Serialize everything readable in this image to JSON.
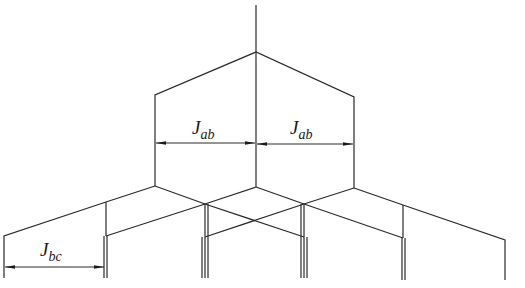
{
  "diagram": {
    "labels": [
      {
        "id": "jab-left",
        "main": "J",
        "sub": "ab",
        "x": 190,
        "y": 118
      },
      {
        "id": "jab-right",
        "main": "J",
        "sub": "ab",
        "x": 290,
        "y": 118
      },
      {
        "id": "jbc",
        "main": "J",
        "sub": "bc",
        "x": 40,
        "y": 240
      }
    ],
    "line_color": "#2a2a2a",
    "background": "#ffffff"
  }
}
